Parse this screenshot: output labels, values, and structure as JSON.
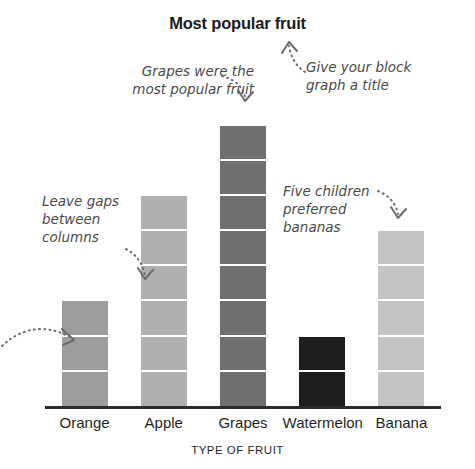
{
  "chart_data": {
    "type": "bar",
    "title": "Most popular fruit",
    "xlabel": "TYPE OF FRUIT",
    "ylabel": "",
    "categories": [
      "Orange",
      "Apple",
      "Grapes",
      "Watermelon",
      "Banana"
    ],
    "values": [
      3,
      6,
      8,
      2,
      5
    ],
    "ylim": [
      0,
      9
    ],
    "grid": false,
    "legend": "none",
    "style": "block graph — each bar is built from stacked unit blocks separated by white gaps",
    "bar_colors": [
      "#9d9d9d",
      "#b0b0b0",
      "#6f6f6f",
      "#1e1e1e",
      "#c4c4c4"
    ],
    "annotations": [
      "Leave gaps between columns",
      "Grapes were the most popular fruit",
      "Give your block graph a title",
      "Five children preferred bananas"
    ]
  },
  "chart": {
    "title": "Most popular fruit",
    "axis_title": "TYPE OF FRUIT",
    "bars": [
      {
        "label": "Orange",
        "blocks": 3,
        "color": "#9d9d9d"
      },
      {
        "label": "Apple",
        "blocks": 6,
        "color": "#b0b0b0"
      },
      {
        "label": "Grapes",
        "blocks": 8,
        "color": "#6f6f6f"
      },
      {
        "label": "Watermelon",
        "blocks": 2,
        "color": "#1e1e1e"
      },
      {
        "label": "Banana",
        "blocks": 5,
        "color": "#c4c4c4"
      }
    ]
  },
  "annotations": {
    "gaps": {
      "line1": "Leave gaps",
      "line2": "between",
      "line3": "columns"
    },
    "grapes": {
      "line1": "Grapes were the",
      "line2": "most popular fruit"
    },
    "title": {
      "line1": "Give your block",
      "line2": "graph a title"
    },
    "bananas": {
      "line1": "Five children",
      "line2": "preferred",
      "line3": "bananas"
    }
  },
  "colors": {
    "axis": "#2b2b2b",
    "text": "#1b1b1b",
    "annotation": "#4a4a4a",
    "background": "#ffffff"
  }
}
